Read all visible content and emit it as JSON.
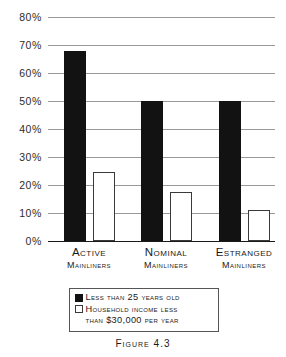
{
  "chart_data": {
    "type": "bar",
    "title": "",
    "subtitle": "",
    "xlabel": "",
    "ylabel": "",
    "ylim": [
      0,
      80
    ],
    "ytick_step": 10,
    "grid": true,
    "legend_position": "below-plot",
    "categories": [
      "Active Mainliners",
      "Nominal Mainliners",
      "Estranged Mainliners"
    ],
    "category_lines": [
      [
        "Active",
        "Mainliners"
      ],
      [
        "Nominal",
        "Mainliners"
      ],
      [
        "Estranged",
        "Mainliners"
      ]
    ],
    "ytick_labels": [
      "80%",
      "70%",
      "60%",
      "50%",
      "40%",
      "30%",
      "20%",
      "10%",
      "0%"
    ],
    "ytick_values": [
      80,
      70,
      60,
      50,
      40,
      30,
      20,
      10,
      0
    ],
    "series": [
      {
        "name": "Less than 25 years old",
        "color": "#121212",
        "style": "filled",
        "values": [
          68,
          50,
          50
        ]
      },
      {
        "name": "Household income less than $30,000 per year",
        "color": "#ffffff",
        "style": "outlined",
        "values": [
          24.5,
          17.5,
          11
        ]
      }
    ],
    "caption": "Figure 4.3"
  },
  "legend": {
    "items": [
      {
        "label": "Less than 25 years old",
        "label_line2": ""
      },
      {
        "label": "Household income less",
        "label_line2": "than $30,000 per year"
      }
    ]
  },
  "caption": {
    "text": "Figure 4.3"
  },
  "colors": {
    "series_dark": "#121212",
    "series_light": "#ffffff",
    "outline": "#3a3a3a",
    "gridline": "#9a9a9a",
    "axis": "#1a1a1a",
    "text": "#1a1a1a"
  }
}
